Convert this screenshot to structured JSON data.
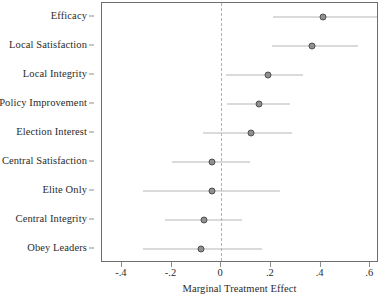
{
  "chart_data": {
    "type": "scatter",
    "subtype": "coefficient-forest-plot",
    "title": "",
    "xlabel": "Marginal Treatment Effect",
    "ylabel": "",
    "xlim": [
      -0.48,
      0.635
    ],
    "xticks": [
      -0.4,
      -0.2,
      0,
      0.2,
      0.4,
      0.6
    ],
    "xticklabels": [
      "-.4",
      "-.2",
      "0",
      ".2",
      ".4",
      ".6"
    ],
    "grid": false,
    "legend": null,
    "reference_line": {
      "x": 0,
      "style": "dashed",
      "color": "#b2b2b2"
    },
    "categories": [
      "Efficacy",
      "Local Satisfaction",
      "Local Integrity",
      "Policy Improvement",
      "Election Interest",
      "Central Satisfaction",
      "Elite Only",
      "Central Integrity",
      "Obey Leaders"
    ],
    "estimates": [
      0.41,
      0.365,
      0.19,
      0.152,
      0.118,
      -0.038,
      -0.038,
      -0.069,
      -0.08
    ],
    "ci_low": [
      0.21,
      0.205,
      0.02,
      0.025,
      -0.075,
      -0.2,
      -0.315,
      -0.225,
      -0.315
    ],
    "ci_high": [
      0.635,
      0.55,
      0.33,
      0.275,
      0.285,
      0.115,
      0.235,
      0.085,
      0.165
    ],
    "point_color": "#8f8f8f",
    "point_edge_color": "#4f4f4f",
    "ci_color": "#b6b6b6"
  }
}
